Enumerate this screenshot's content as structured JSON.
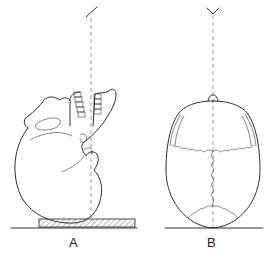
{
  "figure": {
    "panels": [
      {
        "id": "A",
        "label": "A",
        "description": "Lateral view of skull resting on occiput on a hatched block, face tilted upward, with a vertical dashed reference line and a slanted tick mark at top"
      },
      {
        "id": "B",
        "label": "B",
        "description": "Superior view of cranial vault showing coronal, sagittal and lambdoid sutures, with a vertical dashed midline and a V-shaped marker at top"
      }
    ]
  }
}
